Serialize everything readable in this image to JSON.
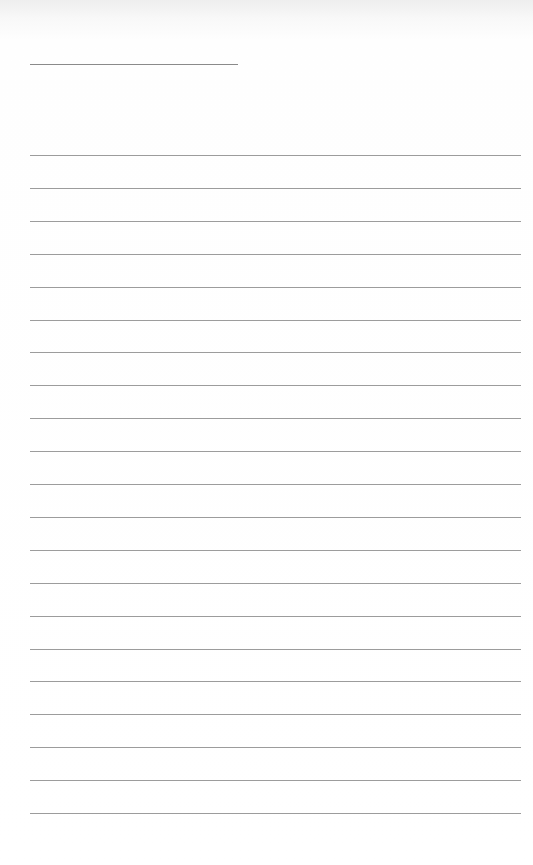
{
  "page": {
    "type": "lined-paper",
    "title_text": "",
    "line_count": 21,
    "first_line_y": 155,
    "line_spacing": 32.9,
    "colors": {
      "paper": "#ffffff",
      "rule": "#9c9c9c",
      "title_rule": "#8a8a8a"
    }
  }
}
